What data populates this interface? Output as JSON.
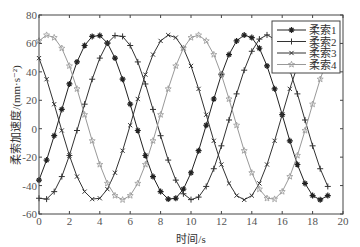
{
  "chart_data": {
    "type": "line",
    "title": "",
    "xlabel": "时间/s",
    "ylabel": "柔索加速度/(mm·s⁻²)",
    "xlim": [
      0,
      20
    ],
    "ylim": [
      -60,
      80
    ],
    "xticks": [
      0,
      2,
      4,
      6,
      8,
      10,
      12,
      14,
      16,
      18,
      20
    ],
    "yticks": [
      -60,
      -40,
      -20,
      0,
      20,
      40,
      60,
      80
    ],
    "grid": false,
    "legend_position": "upper right",
    "x": [
      0,
      0.5,
      1,
      1.5,
      2,
      2.5,
      3,
      3.5,
      4,
      4.5,
      5,
      5.5,
      6,
      6.5,
      7,
      7.5,
      8,
      8.5,
      9,
      9.5,
      10,
      10.5,
      11,
      11.5,
      12,
      12.5,
      13,
      13.5,
      14,
      14.5,
      15,
      15.5,
      16,
      16.5,
      17,
      17.5,
      18,
      18.5,
      19
    ],
    "series": [
      {
        "name": "柔索1",
        "marker": "*",
        "color": "#222222",
        "peak_t": 3.8
      },
      {
        "name": "柔索2",
        "marker": "+",
        "color": "#333333",
        "peak_t": 5.2
      },
      {
        "name": "柔索3",
        "marker": "x",
        "color": "#333333",
        "peak_t": 8.6
      },
      {
        "name": "柔索4",
        "marker": "☆",
        "color": "#999999",
        "peak_t": 0.6
      }
    ],
    "model": {
      "mean": 8,
      "amplitude": 58,
      "period": 9.8,
      "min_clip": -50,
      "max_clip": 66
    }
  }
}
